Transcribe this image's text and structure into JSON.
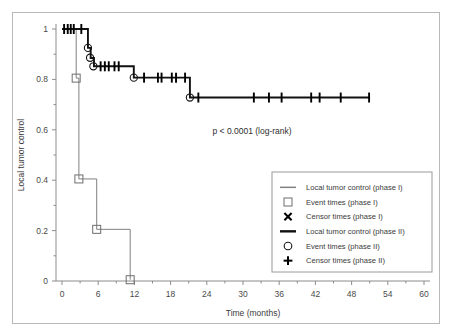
{
  "figure": {
    "background": "#ffffff",
    "frame_color": "#b9b9b9",
    "annotation": "p < 0.0001 (log-rank)"
  },
  "chart_data": {
    "type": "line",
    "subtype": "kaplan-meier-step",
    "title": "",
    "xlabel": "Time (months)",
    "ylabel": "Local tumor control",
    "xlim": [
      0,
      60
    ],
    "ylim": [
      0,
      1
    ],
    "xticks": [
      0,
      6,
      12,
      18,
      24,
      30,
      36,
      42,
      48,
      54,
      60
    ],
    "xticklabels": [
      "0",
      "6",
      "12",
      "18",
      "24",
      "30",
      "36",
      "42",
      "48",
      "54",
      "60"
    ],
    "yticks": [
      0,
      0.2,
      0.4,
      0.6,
      0.8,
      1
    ],
    "yticklabels": [
      "0",
      "0.2",
      "0.4",
      "0.6",
      "0.8",
      "1"
    ],
    "grid": false,
    "legend_position": "lower right",
    "annotations": [
      {
        "text": "p < 0.0001 (log-rank)",
        "x": 31.5,
        "y": 0.585
      }
    ],
    "series": [
      {
        "name": "Local tumor control (phase I)",
        "color": "#808080",
        "linewidth": 1,
        "step": "post",
        "x": [
          0,
          2.35,
          2.35,
          2.8,
          2.8,
          5.75,
          5.75,
          11.3,
          11.3
        ],
        "y": [
          1,
          1,
          0.805,
          0.805,
          0.405,
          0.405,
          0.205,
          0.205,
          0.005
        ],
        "event_times": [
          {
            "x": 2.35,
            "y": 0.805
          },
          {
            "x": 2.8,
            "y": 0.405
          },
          {
            "x": 5.75,
            "y": 0.205
          },
          {
            "x": 11.3,
            "y": 0.005
          }
        ],
        "censor_times": []
      },
      {
        "name": "Local tumor control (phase II)",
        "color": "#111111",
        "linewidth": 1.9,
        "step": "post",
        "x": [
          0,
          4.3,
          4.3,
          4.75,
          4.75,
          5.3,
          5.3,
          11.9,
          11.9,
          21.2,
          21.2,
          51.0
        ],
        "y": [
          1,
          1,
          0.925,
          0.925,
          0.885,
          0.885,
          0.852,
          0.852,
          0.807,
          0.807,
          0.728,
          0.728
        ],
        "event_times": [
          {
            "x": 4.3,
            "y": 0.925
          },
          {
            "x": 4.65,
            "y": 0.886
          },
          {
            "x": 5.2,
            "y": 0.852
          },
          {
            "x": 11.9,
            "y": 0.807
          },
          {
            "x": 21.2,
            "y": 0.728
          }
        ],
        "censor_times": [
          {
            "x": 0.35,
            "y": 1
          },
          {
            "x": 0.95,
            "y": 1
          },
          {
            "x": 1.45,
            "y": 1
          },
          {
            "x": 1.95,
            "y": 1
          },
          {
            "x": 3.2,
            "y": 1
          },
          {
            "x": 6.4,
            "y": 0.852
          },
          {
            "x": 7.1,
            "y": 0.852
          },
          {
            "x": 7.75,
            "y": 0.852
          },
          {
            "x": 8.7,
            "y": 0.852
          },
          {
            "x": 9.4,
            "y": 0.852
          },
          {
            "x": 13.6,
            "y": 0.807
          },
          {
            "x": 15.9,
            "y": 0.807
          },
          {
            "x": 16.5,
            "y": 0.807
          },
          {
            "x": 18.2,
            "y": 0.807
          },
          {
            "x": 18.9,
            "y": 0.807
          },
          {
            "x": 20.4,
            "y": 0.807
          },
          {
            "x": 22.6,
            "y": 0.728
          },
          {
            "x": 31.8,
            "y": 0.728
          },
          {
            "x": 34.3,
            "y": 0.728
          },
          {
            "x": 36.4,
            "y": 0.728
          },
          {
            "x": 41.3,
            "y": 0.728
          },
          {
            "x": 42.7,
            "y": 0.728
          },
          {
            "x": 46.2,
            "y": 0.728
          },
          {
            "x": 50.9,
            "y": 0.728
          }
        ]
      }
    ],
    "legend_entries": [
      {
        "label": "Local tumor control (phase I)",
        "marker": "line-gray"
      },
      {
        "label": "Event times (phase I)",
        "marker": "square-open"
      },
      {
        "label": "Censor times (phase I)",
        "marker": "cross-x"
      },
      {
        "label": "Local tumor control (phase II)",
        "marker": "line-black"
      },
      {
        "label": "Event times (phase II)",
        "marker": "circle-open"
      },
      {
        "label": "Censor times (phase II)",
        "marker": "plus"
      }
    ]
  }
}
